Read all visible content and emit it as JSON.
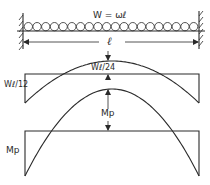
{
  "diagram": {
    "beam": {
      "load_label": "W = ωℓ",
      "span_label": "ℓ",
      "load_circle_count": 20,
      "supports": [
        "fixed-left",
        "fixed-right"
      ]
    },
    "elastic_moment_diagram": {
      "end_moment_label": "Wℓ/12",
      "midspan_moment_label": "Wℓ/24"
    },
    "plastic_moment_diagram": {
      "midspan_moment_label": "Mp",
      "end_moment_label": "Mp"
    }
  },
  "colors": {
    "ink": "#2a2a2a",
    "background": "#ffffff"
  }
}
